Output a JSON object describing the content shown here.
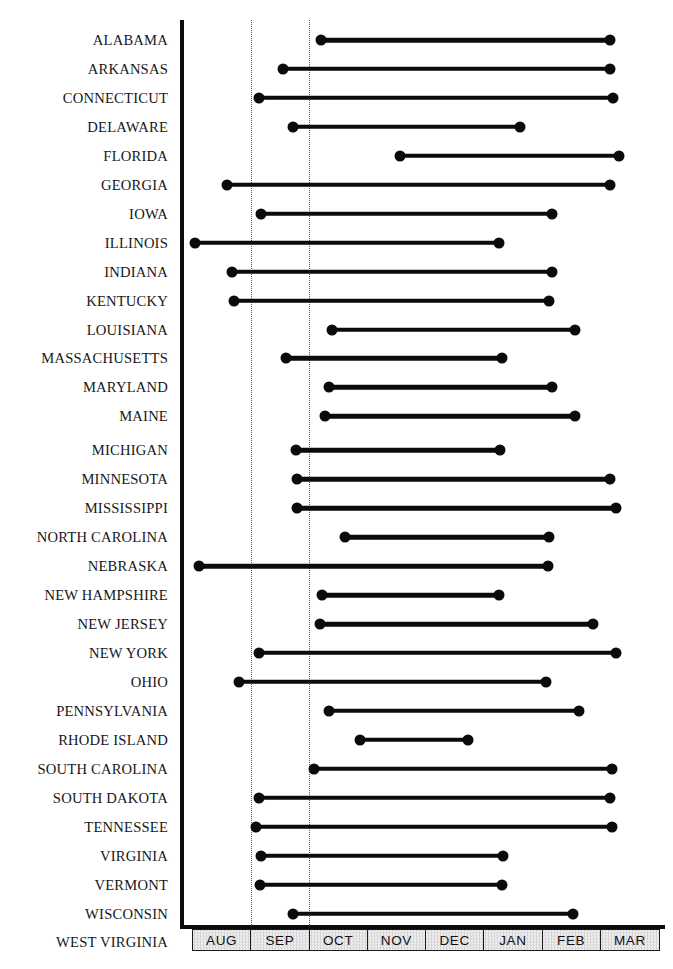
{
  "chart_data": {
    "type": "bar",
    "subtype": "range-dumbbell",
    "title": "",
    "subtitle": "",
    "xlabel": "",
    "ylabel": "",
    "grid": true,
    "legend": false,
    "legend_position": "none",
    "orientation": "horizontal",
    "x_axis": {
      "tick_labels": [
        "AUG",
        "SEP",
        "OCT",
        "NOV",
        "DEC",
        "JAN",
        "FEB",
        "MAR"
      ],
      "range_start": "AUG",
      "range_end": "MAR",
      "units": "month",
      "gridlines_at": [
        "SEP",
        "OCT"
      ]
    },
    "categories": [
      "ALABAMA",
      "ARKANSAS",
      "CONNECTICUT",
      "DELAWARE",
      "FLORIDA",
      "GEORGIA",
      "IOWA",
      "ILLINOIS",
      "INDIANA",
      "KENTUCKY",
      "LOUISIANA",
      "MASSACHUSETTS",
      "MARYLAND",
      "MAINE",
      "MICHIGAN",
      "MINNESOTA",
      "MISSISSIPPI",
      "NORTH CAROLINA",
      "NEBRASKA",
      "NEW HAMPSHIRE",
      "NEW JERSEY",
      "NEW YORK",
      "OHIO",
      "PENNSYLVANIA",
      "RHODE ISLAND",
      "SOUTH CAROLINA",
      "SOUTH DAKOTA",
      "TENNESSEE",
      "VIRGINIA",
      "VERMONT",
      "WISCONSIN",
      "WEST VIRGINIA"
    ],
    "series": [
      {
        "name": "Season range",
        "ranges": [
          {
            "category": "ALABAMA",
            "start": 2.2,
            "end": 7.15
          },
          {
            "category": "ARKANSAS",
            "start": 1.55,
            "end": 7.15
          },
          {
            "category": "CONNECTICUT",
            "start": 1.15,
            "end": 7.2
          },
          {
            "category": "DELAWARE",
            "start": 1.72,
            "end": 5.6
          },
          {
            "category": "FLORIDA",
            "start": 3.55,
            "end": 7.3
          },
          {
            "category": "GEORGIA",
            "start": 0.6,
            "end": 7.15
          },
          {
            "category": "IOWA",
            "start": 1.18,
            "end": 6.15
          },
          {
            "category": "ILLINOIS",
            "start": 0.05,
            "end": 5.25
          },
          {
            "category": "INDIANA",
            "start": 0.68,
            "end": 6.15
          },
          {
            "category": "KENTUCKY",
            "start": 0.72,
            "end": 6.1
          },
          {
            "category": "LOUISIANA",
            "start": 2.4,
            "end": 6.55
          },
          {
            "category": "MASSACHUSETTS",
            "start": 1.6,
            "end": 5.3
          },
          {
            "category": "MARYLAND",
            "start": 2.35,
            "end": 6.15
          },
          {
            "category": "MAINE",
            "start": 2.28,
            "end": 6.55
          },
          {
            "category": "MICHIGAN",
            "start": 1.78,
            "end": 5.27
          },
          {
            "category": "MINNESOTA",
            "start": 1.8,
            "end": 7.15
          },
          {
            "category": "MISSISSIPPI",
            "start": 1.8,
            "end": 7.25
          },
          {
            "category": "NORTH CAROLINA",
            "start": 2.62,
            "end": 6.1
          },
          {
            "category": "NEBRASKA",
            "start": 0.12,
            "end": 6.08
          },
          {
            "category": "NEW HAMPSHIRE",
            "start": 2.22,
            "end": 5.25
          },
          {
            "category": "NEW JERSEY",
            "start": 2.18,
            "end": 6.85
          },
          {
            "category": "NEW YORK",
            "start": 1.15,
            "end": 7.25
          },
          {
            "category": "OHIO",
            "start": 0.8,
            "end": 6.05
          },
          {
            "category": "PENNSYLVANIA",
            "start": 2.35,
            "end": 6.62
          },
          {
            "category": "RHODE ISLAND",
            "start": 2.88,
            "end": 4.72
          },
          {
            "category": "SOUTH CAROLINA",
            "start": 2.08,
            "end": 7.18
          },
          {
            "category": "SOUTH DAKOTA",
            "start": 1.15,
            "end": 7.15
          },
          {
            "category": "TENNESSEE",
            "start": 1.1,
            "end": 7.18
          },
          {
            "category": "VIRGINIA",
            "start": 1.18,
            "end": 5.32
          },
          {
            "category": "VERMONT",
            "start": 1.17,
            "end": 5.3
          },
          {
            "category": "WISCONSIN",
            "start": 1.72,
            "end": 6.52
          },
          {
            "category": "WEST VIRGINIA",
            "start": 2.35,
            "end": 6.5
          }
        ]
      }
    ],
    "colors": {
      "marker": "#0b0b0d",
      "bar": "#0b0b0d",
      "axis": "#0b0b0d",
      "gridline": "#5a5a5e",
      "axis_band_fill": "#e3e3e3",
      "label_text": "#17171a",
      "background": "#ffffff"
    }
  },
  "axis": {
    "months": [
      "AUG",
      "SEP",
      "OCT",
      "NOV",
      "DEC",
      "JAN",
      "FEB",
      "MAR"
    ]
  }
}
